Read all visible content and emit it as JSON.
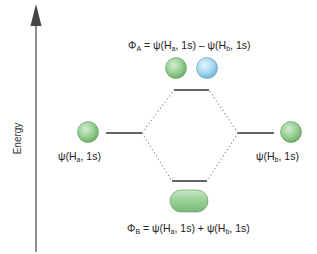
{
  "axis": {
    "label": "Energy",
    "color": "#555555"
  },
  "left_atom": {
    "label_prefix": "ψ(H",
    "label_sub": "a",
    "label_suffix": ", 1s)",
    "color": "#8cc98a"
  },
  "right_atom": {
    "label_prefix": "ψ(H",
    "label_sub": "b",
    "label_suffix": ", 1s)",
    "color": "#8cc98a"
  },
  "antibonding": {
    "symbol": "Φ",
    "symbol_sub": "A",
    "eq": " = ψ(H",
    "sub1": "a",
    "mid": ", 1s) –  ψ(H",
    "sub2": "b",
    "end": ", 1s)",
    "lobe_colors": [
      "#8cc98a",
      "#9fd6f0"
    ]
  },
  "bonding": {
    "symbol": "Φ",
    "symbol_sub": "B",
    "eq": " = ψ(H",
    "sub1": "a",
    "mid": ", 1s) +  ψ(H",
    "sub2": "b",
    "end": ", 1s)",
    "lobe_color": "#8cc98a"
  }
}
